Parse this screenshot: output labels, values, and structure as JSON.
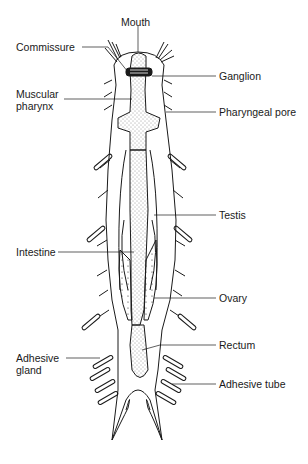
{
  "diagram": {
    "labels": {
      "mouth": "Mouth",
      "commissure": "Commissure",
      "ganglion": "Ganglion",
      "muscular_pharynx": "Muscular\npharynx",
      "pharyngeal_pore": "Pharyngeal pore",
      "testis": "Testis",
      "intestine": "Intestine",
      "ovary": "Ovary",
      "rectum": "Rectum",
      "adhesive_gland": "Adhesive\ngland",
      "adhesive_tube": "Adhesive tube"
    },
    "colors": {
      "line": "#1a1a1a",
      "background": "#ffffff"
    }
  }
}
